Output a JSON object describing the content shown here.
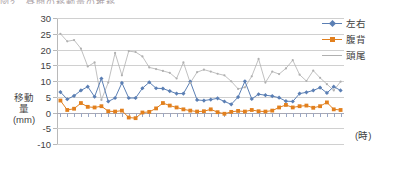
{
  "title_sliver": "図2　昼間の移動量の推移",
  "axes": {
    "y_title_lines": [
      "移動",
      "量",
      "(mm)"
    ],
    "x_title": "(時)",
    "y_ticks": [
      30,
      25,
      20,
      15,
      10,
      5,
      0,
      -5,
      -10
    ],
    "y_min": -10,
    "y_max": 30
  },
  "legend": {
    "position": "top-right",
    "items": [
      {
        "label": "左右",
        "color": "#5b7fb4",
        "marker": "diamond"
      },
      {
        "label": "腹背",
        "color": "#e2801e",
        "marker": "square"
      },
      {
        "label": "頭尾",
        "color": "#b0b0b0",
        "marker": "line"
      }
    ]
  },
  "colors": {
    "series_sayuu": "#5b7fb4",
    "series_fukuhai": "#e2801e",
    "series_toubi": "#b0b0b0",
    "grid": "#d0d0d0",
    "zero_axis": "#a8a8b4",
    "text": "#3f3f3f"
  },
  "chart_data": {
    "type": "line",
    "title": "図2　昼間の移動量の推移",
    "xlabel": "(時)",
    "ylabel": "移動量 (mm)",
    "ylim": [
      -10,
      30
    ],
    "yticks": [
      -10,
      -5,
      0,
      5,
      10,
      15,
      20,
      25,
      30
    ],
    "grid": true,
    "legend_position": "top-right",
    "x": [
      1,
      2,
      3,
      4,
      5,
      6,
      7,
      8,
      9,
      10,
      11,
      12,
      13,
      14,
      15,
      16,
      17,
      18,
      19,
      20,
      21,
      22,
      23,
      24,
      25,
      26,
      27,
      28,
      29,
      30,
      31,
      32,
      33,
      34,
      35,
      36,
      37,
      38,
      39,
      40,
      41,
      42
    ],
    "series": [
      {
        "name": "左右",
        "color": "#5b7fb4",
        "values": [
          6.5,
          4.2,
          5.3,
          7.0,
          8.2,
          5.0,
          10.8,
          3.5,
          4.6,
          9.4,
          4.6,
          4.6,
          7.7,
          9.6,
          7.7,
          7.6,
          6.8,
          6.0,
          6.0,
          9.8,
          4.0,
          3.8,
          4.1,
          4.5,
          3.5,
          2.6,
          4.9,
          9.9,
          4.3,
          5.8,
          5.5,
          5.2,
          4.7,
          3.6,
          3.5,
          6.0,
          6.4,
          7.0,
          7.9,
          6.2,
          8.2,
          7.0
        ]
      },
      {
        "name": "腹背",
        "color": "#e2801e",
        "values": [
          3.8,
          0.8,
          1.2,
          3.0,
          1.8,
          1.6,
          2.0,
          0.4,
          0.3,
          0.6,
          -1.6,
          -1.8,
          0.0,
          0.2,
          1.3,
          3.0,
          2.2,
          1.6,
          1.0,
          0.6,
          0.3,
          0.4,
          1.0,
          0.1,
          -0.4,
          0.2,
          0.5,
          0.3,
          0.8,
          0.4,
          0.3,
          0.6,
          1.6,
          2.4,
          1.6,
          2.0,
          2.2,
          1.5,
          2.0,
          3.2,
          1.0,
          0.8
        ]
      },
      {
        "name": "頭尾",
        "color": "#b0b0b0",
        "values": [
          25.0,
          22.6,
          23.0,
          20.3,
          14.6,
          15.9,
          4.0,
          9.5,
          18.9,
          11.8,
          19.5,
          19.2,
          17.8,
          14.3,
          13.8,
          13.2,
          12.6,
          10.8,
          15.9,
          9.4,
          12.8,
          13.6,
          13.0,
          12.3,
          11.8,
          9.9,
          7.5,
          8.0,
          11.5,
          17.0,
          9.5,
          13.0,
          12.2,
          14.0,
          16.6,
          12.0,
          10.0,
          13.3,
          11.0,
          9.0,
          7.0,
          9.8
        ]
      }
    ]
  }
}
